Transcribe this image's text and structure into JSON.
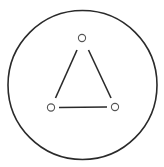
{
  "diagram": {
    "type": "graph",
    "colors": {
      "background": "#ffffff",
      "stroke": "#2a2a2a",
      "node_stroke": "#555555",
      "node_fill": "#ffffff"
    },
    "outer_circle": {
      "cx": 82.5,
      "cy": 85,
      "r": 74.5,
      "stroke_width": 1.6
    },
    "nodes": [
      {
        "id": "top",
        "cx": 82,
        "cy": 38,
        "r": 3.6
      },
      {
        "id": "bottom-left",
        "cx": 51,
        "cy": 107.5,
        "r": 3.6
      },
      {
        "id": "bottom-right",
        "cx": 115,
        "cy": 107,
        "r": 3.6
      }
    ],
    "edges": [
      {
        "from": "top",
        "to": "bottom-left",
        "x1": 77,
        "y1": 50,
        "x2": 55.5,
        "y2": 98
      },
      {
        "from": "top",
        "to": "bottom-right",
        "x1": 88.5,
        "y1": 50,
        "x2": 111,
        "y2": 98
      },
      {
        "from": "bottom-left",
        "to": "bottom-right",
        "x1": 59,
        "y1": 107.5,
        "x2": 107,
        "y2": 107
      }
    ]
  }
}
